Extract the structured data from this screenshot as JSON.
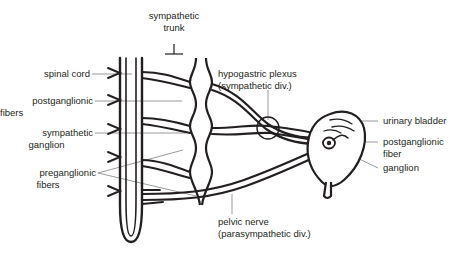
{
  "figure": {
    "type": "anatomical-diagram",
    "ink_color": "#231f20",
    "leader_color": "#6d6e71",
    "background": "#ffffff",
    "labels": {
      "sympathetic_trunk": "sympathetic\ntrunk",
      "sympathetic_trunk_line1": "sympathetic",
      "sympathetic_trunk_line2": "trunk",
      "spinal_cord": "spinal cord",
      "postganglionic_fibers_line1": "postganglionic",
      "postganglionic_fibers_line2": "fibers",
      "sympathetic_ganglion_line1": "sympathetic",
      "sympathetic_ganglion_line2": "ganglion",
      "preganglionic_fibers_line1": "preganglionic",
      "preganglionic_fibers_line2": "fibers",
      "hypogastric_plexus_line1": "hypogastric plexus",
      "hypogastric_plexus_line2": "(sympathetic div.)",
      "pelvic_nerve_line1": "pelvic nerve",
      "pelvic_nerve_line2": "(parasympathetic div.)",
      "urinary_bladder": "urinary bladder",
      "postganglionic_fiber_line1": "postganglionic",
      "postganglionic_fiber_line2": "fiber",
      "ganglion": "ganglion"
    },
    "structures": [
      "spinal-cord",
      "sympathetic-trunk",
      "sympathetic-ganglia",
      "preganglionic-fibers",
      "postganglionic-fibers",
      "hypogastric-plexus",
      "pelvic-nerve",
      "urinary-bladder",
      "bladder-ganglion",
      "urethra"
    ]
  }
}
